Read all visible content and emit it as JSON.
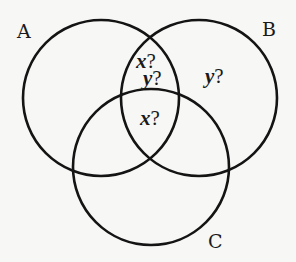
{
  "diagram": {
    "type": "venn",
    "sets": [
      {
        "id": "A",
        "label": "A"
      },
      {
        "id": "B",
        "label": "B"
      },
      {
        "id": "C",
        "label": "C"
      }
    ],
    "regions": [
      {
        "id": "A_and_B_only_top",
        "variable": "x",
        "mark": "?"
      },
      {
        "id": "A_and_B_only_bottom",
        "variable": "y",
        "mark": "?"
      },
      {
        "id": "B_only",
        "variable": "y",
        "mark": "?"
      },
      {
        "id": "A_and_B_and_C",
        "variable": "x",
        "mark": "?"
      }
    ],
    "colors": {
      "stroke": "#141414",
      "background": "#f7f7f5",
      "text": "#1a1a1a"
    }
  }
}
